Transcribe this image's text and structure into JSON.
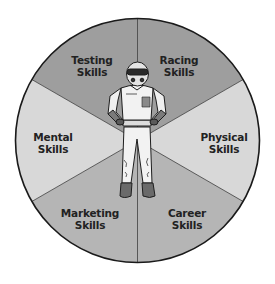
{
  "diagram": {
    "type": "segmented-wheel",
    "center_figure": "race-car-driver-illustration",
    "segments": [
      {
        "id": "testing",
        "line1": "Testing",
        "line2": "Skills",
        "color": "#9e9e9e"
      },
      {
        "id": "racing",
        "line1": "Racing",
        "line2": "Skills",
        "color": "#9e9e9e"
      },
      {
        "id": "physical",
        "line1": "Physical",
        "line2": "Skills",
        "color": "#d8d8d8"
      },
      {
        "id": "career",
        "line1": "Career",
        "line2": "Skills",
        "color": "#b5b5b5"
      },
      {
        "id": "marketing",
        "line1": "Marketing",
        "line2": "Skills",
        "color": "#b5b5b5"
      },
      {
        "id": "mental",
        "line1": "Mental",
        "line2": "Skills",
        "color": "#d8d8d8"
      }
    ]
  }
}
